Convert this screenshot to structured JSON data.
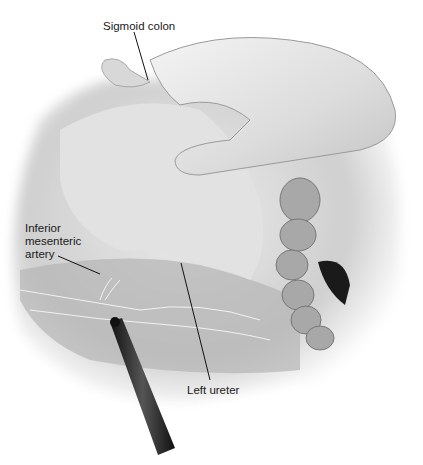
{
  "figure": {
    "palette": {
      "background": "#ffffff",
      "tissue_light": "#e6e6e6",
      "tissue_mid": "#bdbdbd",
      "tissue_dark": "#7a7a7a",
      "instrument": "#1c1c1c",
      "leader": "#111111"
    }
  },
  "labels": {
    "sigmoid_colon": "Sigmoid colon",
    "inferior_mesenteric_artery": "Inferior\nmesenteric\nartery",
    "left_ureter": "Left ureter"
  }
}
